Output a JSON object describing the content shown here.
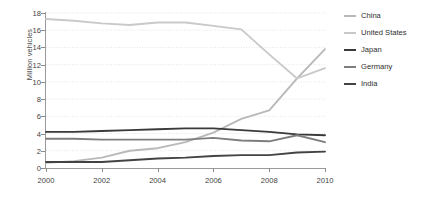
{
  "chart_data": {
    "type": "line",
    "title": "",
    "xlabel": "",
    "ylabel": "Million vehicles",
    "x": [
      2000,
      2001,
      2002,
      2003,
      2004,
      2005,
      2006,
      2007,
      2008,
      2009,
      2010
    ],
    "xlim": [
      2000,
      2010
    ],
    "ylim": [
      0,
      18
    ],
    "ytick_labels": [
      "0",
      "2",
      "4",
      "6",
      "8",
      "10",
      "12",
      "14",
      "16",
      "18"
    ],
    "yticks": [
      0,
      2,
      4,
      6,
      8,
      10,
      12,
      14,
      16,
      18
    ],
    "xtick_labels": [
      "2000",
      "2002",
      "2004",
      "2006",
      "2008",
      "2010"
    ],
    "xticks": [
      2000,
      2002,
      2004,
      2006,
      2008,
      2010
    ],
    "grid": "horizontal-dotted",
    "legend_position": "right",
    "series": [
      {
        "name": "China",
        "color": "#b9b9b9",
        "values": [
          0.6,
          0.8,
          1.2,
          2.0,
          2.3,
          3.0,
          4.1,
          5.7,
          6.7,
          10.4,
          13.8
        ]
      },
      {
        "name": "United States",
        "color": "#c9c9c9",
        "values": [
          17.3,
          17.1,
          16.8,
          16.6,
          16.9,
          16.9,
          16.5,
          16.1,
          13.2,
          10.4,
          11.6
        ]
      },
      {
        "name": "Japan",
        "color": "#3a3a3a",
        "values": [
          4.2,
          4.2,
          4.3,
          4.4,
          4.5,
          4.6,
          4.6,
          4.4,
          4.2,
          3.9,
          3.8
        ]
      },
      {
        "name": "Germany",
        "color": "#7e7e7e",
        "values": [
          3.4,
          3.4,
          3.3,
          3.3,
          3.3,
          3.3,
          3.5,
          3.2,
          3.1,
          3.8,
          3.0
        ]
      },
      {
        "name": "India",
        "color": "#434343",
        "values": [
          0.7,
          0.7,
          0.7,
          0.9,
          1.1,
          1.2,
          1.4,
          1.5,
          1.5,
          1.8,
          1.9
        ]
      }
    ]
  },
  "legend": {
    "items": [
      {
        "label": "China"
      },
      {
        "label": "United States"
      },
      {
        "label": "Japan"
      },
      {
        "label": "Germany"
      },
      {
        "label": "India"
      }
    ]
  },
  "axes": {
    "y_title": "Million vehicles"
  },
  "caption": ""
}
